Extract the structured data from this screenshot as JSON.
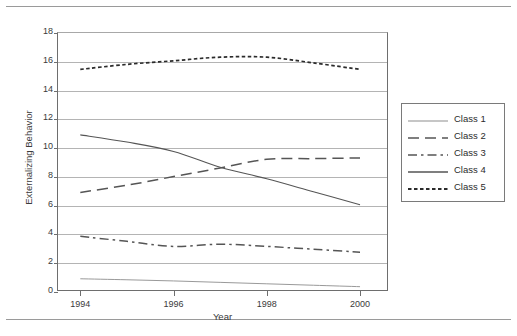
{
  "page": {
    "top_rule": true,
    "bottom_rule": true
  },
  "chart_data": {
    "type": "line",
    "title": "",
    "xlabel": "Year",
    "ylabel": "Externalizing Behavior",
    "x": [
      1994,
      1995,
      1996,
      1997,
      1998,
      1999,
      2000
    ],
    "xticks": [
      "1994",
      "1996",
      "1998",
      "2000"
    ],
    "xtick_values": [
      1994,
      1996,
      1998,
      2000
    ],
    "xlim": [
      1993.5,
      2000.6
    ],
    "yticks": [
      "0",
      "2",
      "4",
      "6",
      "8",
      "10",
      "12",
      "14",
      "16",
      "18"
    ],
    "ytick_values": [
      0,
      2,
      4,
      6,
      8,
      10,
      12,
      14,
      16,
      18
    ],
    "ylim": [
      0,
      18
    ],
    "grid": "horizontal",
    "legend_position": "right",
    "series": [
      {
        "name": "Class 1",
        "style": "solid-thin",
        "color": "#8d8d8d",
        "values": [
          0.85,
          0.78,
          0.7,
          0.6,
          0.5,
          0.4,
          0.3
        ]
      },
      {
        "name": "Class 2",
        "style": "long-dash",
        "color": "#555555",
        "values": [
          6.85,
          7.35,
          7.95,
          8.55,
          9.15,
          9.2,
          9.25
        ]
      },
      {
        "name": "Class 3",
        "style": "dash-dot",
        "color": "#555555",
        "values": [
          3.8,
          3.45,
          3.1,
          3.25,
          3.1,
          2.9,
          2.7
        ]
      },
      {
        "name": "Class 4",
        "style": "solid",
        "color": "#555555",
        "values": [
          10.85,
          10.35,
          9.7,
          8.6,
          7.8,
          6.9,
          6.0
        ]
      },
      {
        "name": "Class 5",
        "style": "dotted",
        "color": "#2b2b2b",
        "values": [
          15.4,
          15.75,
          16.0,
          16.25,
          16.25,
          15.85,
          15.4
        ]
      }
    ]
  }
}
